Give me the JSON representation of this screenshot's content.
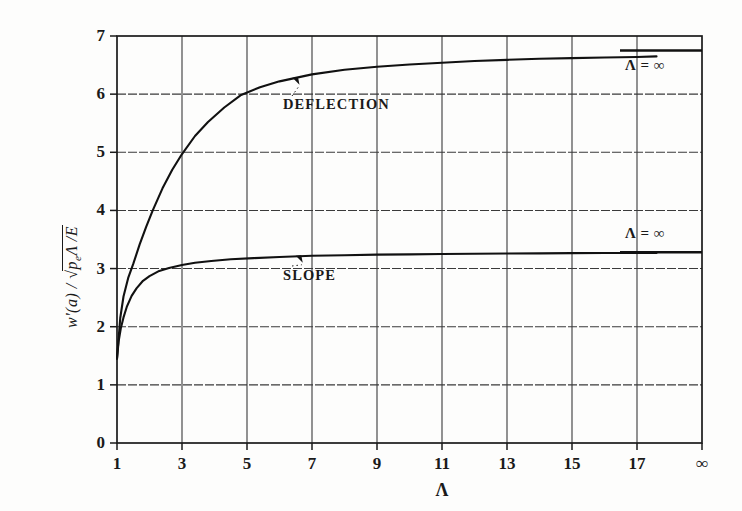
{
  "chart_data": {
    "type": "line",
    "title": "",
    "subtitle": "",
    "xlabel": "Λ",
    "ylabel": "w'(a) / √(p_e Λ / E)",
    "xlim": [
      1,
      19
    ],
    "ylim": [
      0,
      7
    ],
    "grid": true,
    "legend_position": "inline-annotation",
    "x_ticks": [
      "1",
      "3",
      "5",
      "7",
      "9",
      "11",
      "13",
      "15",
      "17",
      "∞"
    ],
    "x_tick_values": [
      1,
      3,
      5,
      7,
      9,
      11,
      13,
      15,
      17,
      19
    ],
    "y_ticks": [
      "0",
      "1",
      "2",
      "3",
      "4",
      "5",
      "6",
      "7"
    ],
    "y_tick_values": [
      0,
      1,
      2,
      3,
      4,
      5,
      6,
      7
    ],
    "series": [
      {
        "name": "DEFLECTION",
        "label": "DEFLECTION",
        "asymptote_label": "Λ = ∞",
        "asymptote_value": 6.75,
        "x": [
          1.0,
          1.1,
          1.2,
          1.35,
          1.5,
          1.7,
          1.9,
          2.1,
          2.4,
          2.7,
          3.0,
          3.4,
          3.8,
          4.3,
          4.8,
          5.4,
          6.0,
          7.0,
          8.0,
          9.0,
          10.0,
          11.0,
          12.0,
          13.0,
          14.0,
          15.0,
          16.0,
          17.0,
          17.6
        ],
        "y": [
          1.45,
          2.15,
          2.52,
          2.85,
          3.08,
          3.42,
          3.72,
          4.0,
          4.38,
          4.7,
          4.97,
          5.28,
          5.52,
          5.77,
          5.98,
          6.12,
          6.22,
          6.34,
          6.42,
          6.47,
          6.51,
          6.54,
          6.57,
          6.59,
          6.61,
          6.62,
          6.63,
          6.64,
          6.65
        ]
      },
      {
        "name": "SLOPE",
        "label": "SLOPE",
        "asymptote_label": "Λ = ∞",
        "asymptote_value": 3.28,
        "x": [
          1.0,
          1.05,
          1.12,
          1.2,
          1.3,
          1.45,
          1.6,
          1.8,
          2.0,
          2.3,
          2.6,
          3.0,
          3.4,
          3.9,
          4.5,
          5.2,
          6.0,
          7.0,
          8.0,
          9.0,
          10.0,
          11.0,
          12.0,
          13.0,
          14.0,
          15.0,
          16.0,
          17.0,
          17.6
        ],
        "y": [
          1.45,
          1.75,
          1.98,
          2.16,
          2.34,
          2.53,
          2.66,
          2.79,
          2.87,
          2.96,
          3.01,
          3.06,
          3.1,
          3.13,
          3.16,
          3.18,
          3.2,
          3.22,
          3.23,
          3.24,
          3.245,
          3.25,
          3.255,
          3.26,
          3.262,
          3.265,
          3.267,
          3.268,
          3.27
        ]
      }
    ],
    "annotations": [
      {
        "text": "DEFLECTION",
        "target_x": 6.4,
        "target_y": 6.28
      },
      {
        "text": "SLOPE",
        "target_x": 6.5,
        "target_y": 3.22
      }
    ]
  },
  "axis": {
    "x_title": "Λ",
    "y_title_parts": {
      "numerator": "w'(a)",
      "slash": "/",
      "radical": "√",
      "radicand_left": "p",
      "radicand_sub": "e",
      "radicand_mid": "Λ /",
      "radicand_right": "E"
    }
  },
  "colors": {
    "ink": "#1a1a1a",
    "grid": "#3a3a3a",
    "background": "#fdfdfc",
    "curve": "#111111"
  }
}
